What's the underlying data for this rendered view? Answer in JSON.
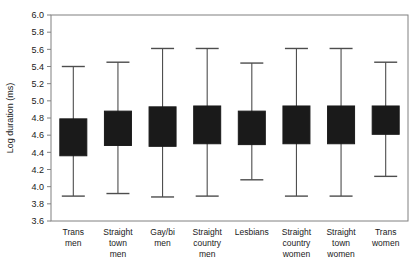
{
  "chart_data": {
    "type": "box",
    "title": "",
    "xlabel": "",
    "ylabel": "Log duration (ms)",
    "ylim": [
      3.6,
      6.0
    ],
    "ytick_step": 0.2,
    "yticks": [
      "6.0",
      "5.8",
      "5.6",
      "5.4",
      "5.2",
      "5.0",
      "4.8",
      "4.6",
      "4.4",
      "4.2",
      "4.0",
      "3.8",
      "3.6"
    ],
    "grid": false,
    "legend": "none",
    "box_fill_color": "#1a1a1a",
    "line_color": "#4d4d4d",
    "frame_color": "#808080",
    "categories": [
      "Trans men",
      "Straight town men",
      "Gay/bi men",
      "Straight country men",
      "Lesbians",
      "Straight country women",
      "Straight town women",
      "Trans women"
    ],
    "category_lines": [
      [
        "Trans",
        "men"
      ],
      [
        "Straight",
        "town",
        "men"
      ],
      [
        "Gay/bi",
        "men"
      ],
      [
        "Straight",
        "country",
        "men"
      ],
      [
        "Lesbians"
      ],
      [
        "Straight",
        "country",
        "women"
      ],
      [
        "Straight",
        "town",
        "women"
      ],
      [
        "Trans",
        "women"
      ]
    ],
    "boxes": [
      {
        "category": "Trans men",
        "whisker_low": 3.89,
        "q1": 4.36,
        "q3": 4.79,
        "whisker_high": 5.4
      },
      {
        "category": "Straight town men",
        "whisker_low": 3.92,
        "q1": 4.48,
        "q3": 4.88,
        "whisker_high": 5.45
      },
      {
        "category": "Gay/bi men",
        "whisker_low": 3.88,
        "q1": 4.47,
        "q3": 4.93,
        "whisker_high": 5.61
      },
      {
        "category": "Straight country men",
        "whisker_low": 3.89,
        "q1": 4.5,
        "q3": 4.94,
        "whisker_high": 5.61
      },
      {
        "category": "Lesbians",
        "whisker_low": 4.08,
        "q1": 4.49,
        "q3": 4.88,
        "whisker_high": 5.44
      },
      {
        "category": "Straight country women",
        "whisker_low": 3.89,
        "q1": 4.5,
        "q3": 4.94,
        "whisker_high": 5.61
      },
      {
        "category": "Straight town women",
        "whisker_low": 3.89,
        "q1": 4.5,
        "q3": 4.94,
        "whisker_high": 5.61
      },
      {
        "category": "Trans women",
        "whisker_low": 4.12,
        "q1": 4.61,
        "q3": 4.94,
        "whisker_high": 5.45
      }
    ]
  }
}
